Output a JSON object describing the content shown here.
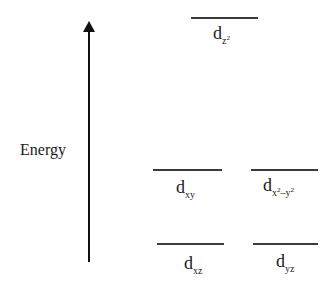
{
  "axis": {
    "label": "Energy",
    "direction": "up"
  },
  "levels": [
    {
      "id": "dz2",
      "main": "d",
      "sub": "z",
      "sup": "2",
      "tier": "top"
    },
    {
      "id": "dxy",
      "main": "d",
      "sub": "xy",
      "tier": "middle"
    },
    {
      "id": "dx2y2",
      "main": "d",
      "sub_parts": [
        "x",
        "2",
        "–y",
        "2"
      ],
      "tier": "middle"
    },
    {
      "id": "dxz",
      "main": "d",
      "sub": "xz",
      "tier": "bottom"
    },
    {
      "id": "dyz",
      "main": "d",
      "sub": "yz",
      "tier": "bottom"
    }
  ]
}
